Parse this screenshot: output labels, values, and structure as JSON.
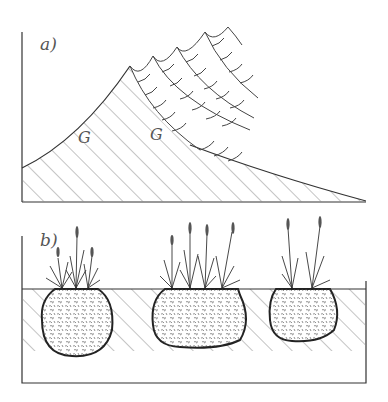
{
  "figure": {
    "panel_a": {
      "label": "a)",
      "annotations": [
        "G",
        "G"
      ],
      "description": "Successive tussock growth layers building up over a sloping hatched substrate"
    },
    "panel_b": {
      "label": "b)",
      "tussock_count": 3,
      "description": "Three grass tussocks with root balls sunk into hatched soil"
    },
    "colors": {
      "line": "#333333",
      "hatch": "#888888",
      "background": "#ffffff"
    }
  }
}
